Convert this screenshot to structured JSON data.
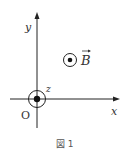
{
  "diagram": {
    "axis_labels": {
      "x": "x",
      "y": "y",
      "z": "z"
    },
    "origin_label": "O",
    "field_label": "B",
    "field_direction": "out-of-page",
    "caption": "図 1",
    "colors": {
      "stroke": "#222222",
      "text": "#333333"
    }
  }
}
